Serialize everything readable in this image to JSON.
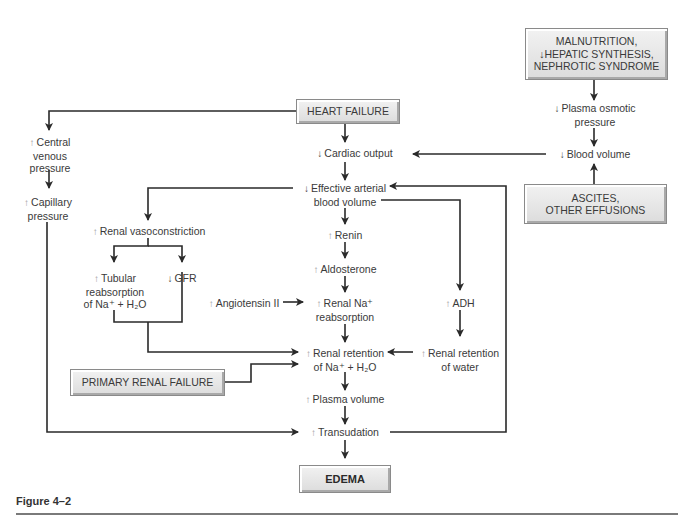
{
  "figure_caption": "Figure 4–2",
  "colors": {
    "line": "#2a2a2a",
    "box_fill": "#e6e6e6",
    "box_border": "#8a8a8a",
    "increase_arrow": "#9a9a9a",
    "decrease_arrow": "#444444",
    "rule": "#7a7a7a"
  },
  "boxes": {
    "heart_failure": "HEART FAILURE",
    "malnutrition": [
      "MALNUTRITION,",
      "↓HEPATIC SYNTHESIS,",
      "NEPHROTIC SYNDROME"
    ],
    "ascites": [
      "ASCITES,",
      "OTHER EFFUSIONS"
    ],
    "primary_renal_failure": "PRIMARY RENAL FAILURE",
    "edema": "EDEMA"
  },
  "nodes": {
    "central_venous_pressure": {
      "dir": "↑",
      "lines": [
        "Central",
        "venous",
        "pressure"
      ]
    },
    "capillary_pressure": {
      "dir": "↑",
      "lines": [
        "Capillary",
        "pressure"
      ]
    },
    "cardiac_output": {
      "dir": "↓",
      "lines": [
        "Cardiac output"
      ]
    },
    "effective_arterial_blood_volume": {
      "dir": "↓",
      "lines": [
        "Effective arterial",
        "blood volume"
      ]
    },
    "renal_vasoconstriction": {
      "dir": "↑",
      "lines": [
        "Renal vasoconstriction"
      ]
    },
    "tubular_reabsorption": {
      "dir": "↑",
      "lines": [
        "Tubular",
        "reabsorption",
        "of Na⁺ + H₂O"
      ]
    },
    "gfr": {
      "dir": "↓",
      "lines": [
        "GFR"
      ]
    },
    "renin": {
      "dir": "↑",
      "lines": [
        "Renin"
      ]
    },
    "aldosterone": {
      "dir": "↑",
      "lines": [
        "Aldosterone"
      ]
    },
    "angiotensin_ii": {
      "dir": "↑",
      "lines": [
        "Angiotensin II"
      ]
    },
    "renal_na_reabsorption": {
      "dir": "↑",
      "lines": [
        "Renal Na⁺",
        "reabsorption"
      ]
    },
    "adh": {
      "dir": "↑",
      "lines": [
        "ADH"
      ]
    },
    "renal_retention_na_h2o": {
      "dir": "↑",
      "lines": [
        "Renal retention",
        "of Na⁺ + H₂O"
      ]
    },
    "renal_retention_water": {
      "dir": "↑",
      "lines": [
        "Renal retention",
        "of water"
      ]
    },
    "plasma_volume": {
      "dir": "↑",
      "lines": [
        "Plasma volume"
      ]
    },
    "transudation": {
      "dir": "↑",
      "lines": [
        "Transudation"
      ]
    },
    "plasma_osmotic_pressure": {
      "dir": "↓",
      "lines": [
        "Plasma osmotic",
        "pressure"
      ]
    },
    "blood_volume": {
      "dir": "↓",
      "lines": [
        "Blood volume"
      ]
    }
  }
}
